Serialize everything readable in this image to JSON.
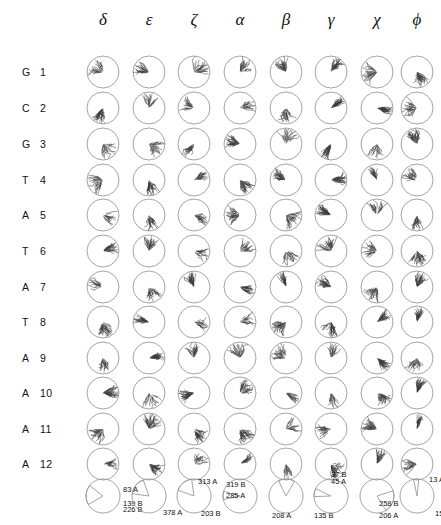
{
  "figure": {
    "type": "circular-angle-distribution-grid"
  },
  "columns": [
    {
      "id": "delta",
      "label": "δ",
      "x": 103
    },
    {
      "id": "epsilon",
      "label": "ε",
      "x": 149
    },
    {
      "id": "zeta",
      "label": "ζ",
      "x": 194
    },
    {
      "id": "alpha",
      "label": "α",
      "x": 240
    },
    {
      "id": "beta",
      "label": "β",
      "x": 286
    },
    {
      "id": "gamma",
      "label": "γ",
      "x": 331
    },
    {
      "id": "chi",
      "label": "χ",
      "x": 377
    },
    {
      "id": "phi",
      "label": "ϕ",
      "x": 417
    }
  ],
  "rows": [
    {
      "base": "G",
      "number": "1",
      "y": 72
    },
    {
      "base": "C",
      "number": "2",
      "y": 108
    },
    {
      "base": "G",
      "number": "3",
      "y": 144
    },
    {
      "base": "T",
      "number": "4",
      "y": 180
    },
    {
      "base": "A",
      "number": "5",
      "y": 215
    },
    {
      "base": "T",
      "number": "6",
      "y": 251
    },
    {
      "base": "A",
      "number": "7",
      "y": 287
    },
    {
      "base": "T",
      "number": "8",
      "y": 322
    },
    {
      "base": "A",
      "number": "9",
      "y": 358
    },
    {
      "base": "A",
      "number": "10",
      "y": 393
    },
    {
      "base": "A",
      "number": "11",
      "y": 429
    },
    {
      "base": "A",
      "number": "12",
      "y": 464
    }
  ],
  "chart_data": {
    "type": "pie",
    "title": "",
    "legend": "",
    "note": "Bottom summary row: one pie chart per torsion-angle column; wedge labels give an angle in degrees followed by a conformer class letter (A or B).",
    "pies": [
      {
        "column": "delta",
        "cx": 103,
        "slices": [
          {
            "label": "83 A",
            "value": 83,
            "class": "A"
          },
          {
            "label": "139 B",
            "value": 139,
            "class": "B"
          },
          {
            "label": "226 B",
            "value": 226,
            "class": "B"
          }
        ]
      },
      {
        "column": "epsilon",
        "cx": 149,
        "slices": [
          {
            "label": "378 A",
            "value": 378,
            "class": "A"
          }
        ]
      },
      {
        "column": "zeta",
        "cx": 194,
        "slices": [
          {
            "label": "313 A",
            "value": 313,
            "class": "A"
          },
          {
            "label": "203 B",
            "value": 203,
            "class": "B"
          }
        ]
      },
      {
        "column": "alpha",
        "cx": 240,
        "slices": [
          {
            "label": "319 B",
            "value": 319,
            "class": "B"
          },
          {
            "label": "285 A",
            "value": 285,
            "class": "A"
          }
        ]
      },
      {
        "column": "beta",
        "cx": 286,
        "slices": [
          {
            "label": "208 A",
            "value": 208,
            "class": "A"
          },
          {
            "label": "135 B",
            "value": 135,
            "class": "B"
          }
        ]
      },
      {
        "column": "gamma",
        "cx": 331,
        "slices": [
          {
            "label": "37 B",
            "value": 37,
            "class": "B"
          },
          {
            "label": "45 A",
            "value": 45,
            "class": "A"
          }
        ]
      },
      {
        "column": "chi",
        "cx": 377,
        "slices": [
          {
            "label": "258 B",
            "value": 258,
            "class": "B"
          },
          {
            "label": "206 A",
            "value": 206,
            "class": "A"
          }
        ]
      },
      {
        "column": "phi",
        "cx": 417,
        "slices": [
          {
            "label": "13 A",
            "value": 13,
            "class": "A"
          },
          {
            "label": "154 B",
            "value": 154,
            "class": "B"
          }
        ]
      }
    ]
  },
  "style": {
    "circle_stroke": "#9a9a9a",
    "trace_stroke": "#3a3a3a",
    "text_color": "#111111",
    "background": "#ffffff"
  },
  "geometry": {
    "cell_radius": 16,
    "pie_radius": 17,
    "header_y": 20,
    "pie_row_y": 496
  }
}
